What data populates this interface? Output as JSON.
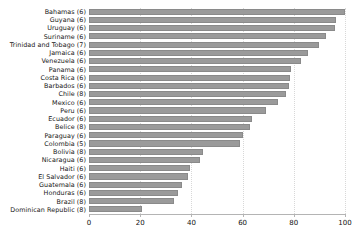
{
  "chart_data": {
    "type": "bar",
    "orientation": "horizontal",
    "title": "",
    "subtitle": "",
    "xlabel": "",
    "ylabel": "",
    "xlim": [
      0,
      100
    ],
    "grid": true,
    "legend": false,
    "legend_position": "none",
    "bar_color": "#9a9a9a",
    "bar_edge_color": "#8a8a8a",
    "axis_color": "#b4b4b4",
    "gridline_color": "#d8d8d8",
    "xticks": [
      0,
      20,
      40,
      60,
      80,
      100
    ],
    "xtick_labels": [
      "0",
      "20",
      "40",
      "60",
      "80",
      "100"
    ],
    "categories": [
      "Bahamas (6)",
      "Guyana (6)",
      "Uruguay (6)",
      "Suriname (6)",
      "Trinidad and Tobago (7)",
      "Jamaica (6)",
      "Venezuela (6)",
      "Panama (6)",
      "Costa Rica (6)",
      "Barbados (6)",
      "Chile (8)",
      "Mexico (6)",
      "Peru (6)",
      "Ecuador (6)",
      "Belice (8)",
      "Paraguay (6)",
      "Colombia (5)",
      "Bolivia (8)",
      "Nicaragua (6)",
      "Haiti (6)",
      "El Salvador (6)",
      "Guatemala (6)",
      "Honduras (6)",
      "Brazil (8)",
      "Dominican Republic (8)"
    ],
    "values": [
      100.0,
      96.5,
      96.0,
      92.5,
      90.0,
      85.5,
      83.0,
      79.0,
      78.7,
      78.0,
      77.0,
      74.0,
      69.0,
      63.5,
      63.0,
      60.0,
      59.0,
      44.5,
      43.5,
      39.5,
      38.5,
      36.5,
      34.8,
      33.2,
      20.7
    ]
  }
}
